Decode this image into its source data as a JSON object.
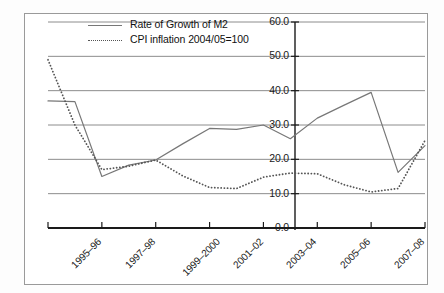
{
  "chart_data": {
    "type": "line",
    "title": "",
    "xlabel": "",
    "ylabel": "",
    "ylim": [
      0.0,
      60.0
    ],
    "ytick_labels": [
      "0.0",
      "10.0",
      "20.0",
      "30.0",
      "40.0",
      "50.0",
      "60.0"
    ],
    "yticks": [
      0.0,
      10.0,
      20.0,
      30.0,
      40.0,
      50.0,
      60.0
    ],
    "grid": true,
    "grid_axis": "y",
    "legend_position": "top-left-inside",
    "categories": [
      "1995-96",
      "1996-97",
      "1997-98",
      "1998-99",
      "1999-2000",
      "2000-01",
      "2001-02",
      "2002-03",
      "2003-04",
      "2004-05",
      "2005-06",
      "2006-07",
      "2007-08",
      "2008-09",
      "2009-10"
    ],
    "xtick_labels": [
      "1995–96",
      "1997–98",
      "1999–2000",
      "2001–02",
      "2003–04",
      "2005–06",
      "2007–08",
      "2009–10"
    ],
    "xtick_categories": [
      "1995-96",
      "1997-98",
      "1999-2000",
      "2001-02",
      "2003-04",
      "2005-06",
      "2007-08",
      "2009-10"
    ],
    "series": [
      {
        "name": "Rate of Growth of M2",
        "style": "solid",
        "color": "#777777",
        "values": [
          37.0,
          36.8,
          15.0,
          18.3,
          19.8,
          24.5,
          29.0,
          28.7,
          30.0,
          26.0,
          32.0,
          35.8,
          39.5,
          16.2,
          24.0
        ]
      },
      {
        "name": "CPI inflation 2004/05=100",
        "style": "dotted",
        "color": "#555555",
        "values": [
          49.0,
          30.0,
          17.0,
          18.0,
          19.8,
          15.2,
          11.8,
          11.5,
          14.8,
          16.0,
          15.8,
          12.6,
          10.5,
          11.5,
          25.5
        ]
      }
    ],
    "colors": {
      "grid": "#8c8c8c",
      "axis": "#1a1a1a",
      "frame": "#9a9a9a",
      "text": "#111111"
    }
  }
}
